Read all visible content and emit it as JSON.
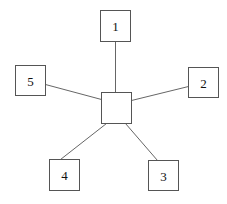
{
  "diagram": {
    "type": "star-topology",
    "width": 227,
    "height": 204,
    "colors": {
      "background": "#ffffff",
      "box_stroke": "#555555",
      "edge_stroke": "#666666",
      "label": "#111111"
    },
    "hub": {
      "id": "hub",
      "label": "",
      "x": 101,
      "y": 92,
      "w": 30,
      "h": 31
    },
    "nodes": [
      {
        "id": "n1",
        "label": "1",
        "x": 100,
        "y": 10,
        "w": 30,
        "h": 31
      },
      {
        "id": "n2",
        "label": "2",
        "x": 188,
        "y": 67,
        "w": 30,
        "h": 30
      },
      {
        "id": "n3",
        "label": "3",
        "x": 148,
        "y": 160,
        "w": 30,
        "h": 30
      },
      {
        "id": "n4",
        "label": "4",
        "x": 49,
        "y": 159,
        "w": 30,
        "h": 31
      },
      {
        "id": "n5",
        "label": "5",
        "x": 15,
        "y": 65,
        "w": 30,
        "h": 30
      }
    ],
    "edges": [
      {
        "from": "n1",
        "to": "hub",
        "x1": 115,
        "y1": 41,
        "x2": 115,
        "y2": 92
      },
      {
        "from": "n2",
        "to": "hub",
        "x1": 188,
        "y1": 86,
        "x2": 131,
        "y2": 100
      },
      {
        "from": "n3",
        "to": "hub",
        "x1": 157,
        "y1": 160,
        "x2": 125,
        "y2": 123
      },
      {
        "from": "n4",
        "to": "hub",
        "x1": 60,
        "y1": 159,
        "x2": 106,
        "y2": 123
      },
      {
        "from": "n5",
        "to": "hub",
        "x1": 45,
        "y1": 84,
        "x2": 101,
        "y2": 99
      }
    ]
  }
}
